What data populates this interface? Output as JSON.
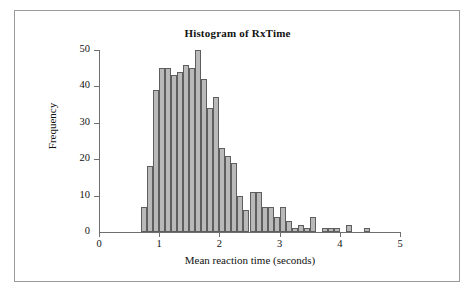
{
  "figure": {
    "title": "Histogram of RxTime",
    "frame": {
      "visible": true,
      "color": "#9a9a9a"
    }
  },
  "axes": {
    "x_label": "Mean reaction time (seconds)",
    "y_label": "Frequency",
    "x_ticks": [
      "0",
      "1",
      "2",
      "3",
      "4",
      "5"
    ],
    "y_ticks": [
      "0",
      "10",
      "20",
      "30",
      "40",
      "50"
    ]
  },
  "colors": {
    "bar_fill": "#b9b9b9",
    "bar_edge": "#5e5e5e",
    "axis": "#6f6f6f",
    "text": "#111111",
    "frame": "#9a9a9a"
  },
  "chart_data": {
    "type": "bar",
    "title": "Histogram of RxTime",
    "xlabel": "Mean reaction time (seconds)",
    "ylabel": "Frequency",
    "xlim": [
      0,
      5
    ],
    "ylim": [
      0,
      50
    ],
    "grid": false,
    "legend": null,
    "bin_width": 0.1,
    "categories": [
      "0.7",
      "0.8",
      "0.9",
      "1.0",
      "1.1",
      "1.2",
      "1.3",
      "1.4",
      "1.5",
      "1.6",
      "1.7",
      "1.8",
      "1.9",
      "2.0",
      "2.1",
      "2.2",
      "2.3",
      "2.4",
      "2.5",
      "2.6",
      "2.7",
      "2.8",
      "2.9",
      "3.0",
      "3.1",
      "3.2",
      "3.3",
      "3.4",
      "3.5",
      "3.6",
      "3.7",
      "3.8",
      "3.9",
      "4.0",
      "4.1",
      "4.2",
      "4.3",
      "4.4",
      "4.5"
    ],
    "bin_starts": [
      0.7,
      0.8,
      0.9,
      1.0,
      1.1,
      1.2,
      1.3,
      1.4,
      1.5,
      1.6,
      1.7,
      1.8,
      1.9,
      2.0,
      2.1,
      2.2,
      2.3,
      2.4,
      2.5,
      2.6,
      2.7,
      2.8,
      2.9,
      3.0,
      3.1,
      3.2,
      3.3,
      3.4,
      3.5,
      3.6,
      3.7,
      3.8,
      3.9,
      4.0,
      4.1,
      4.2,
      4.3,
      4.4,
      4.5
    ],
    "values": [
      7,
      18,
      39,
      45,
      45,
      43,
      44,
      46,
      45,
      50,
      42,
      34,
      37,
      23,
      21,
      19,
      10,
      6,
      11,
      11,
      7,
      7,
      4,
      7,
      3,
      1,
      2,
      1,
      4,
      0,
      1,
      1,
      1,
      0,
      2,
      0,
      0,
      1,
      0
    ]
  }
}
